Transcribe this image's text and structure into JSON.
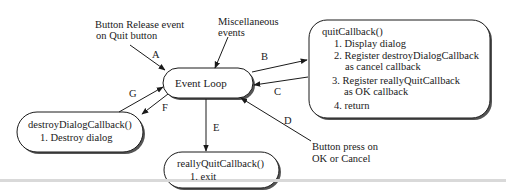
{
  "nodes": {
    "event_loop": {
      "label": "Event Loop"
    },
    "quit_callback": {
      "title": "quitCallback()",
      "steps": [
        "1. Display dialog",
        "2. Register destroyDialogCallback",
        "as cancel callback",
        "3. Register reallyQuitCallback",
        "as OK callback",
        "4. return"
      ]
    },
    "destroy_dialog_callback": {
      "title": "destroyDialogCallback()",
      "steps": [
        "1. Destroy dialog"
      ]
    },
    "really_quit_callback": {
      "title": "reallyQuitCallback()",
      "steps": [
        "1. exit"
      ]
    }
  },
  "external_events": {
    "button_release": {
      "line1": "Button Release event",
      "line2": "on Quit button"
    },
    "misc": {
      "line1": "Miscellaneous",
      "line2": "events"
    },
    "button_press": {
      "line1": "Button press on",
      "line2": "OK or Cancel"
    }
  },
  "edges": [
    {
      "id": "A",
      "from": "button_release",
      "to": "event_loop"
    },
    {
      "id": "B",
      "from": "event_loop",
      "to": "quit_callback"
    },
    {
      "id": "C",
      "from": "quit_callback",
      "to": "event_loop"
    },
    {
      "id": "D",
      "from": "button_press",
      "to": "event_loop"
    },
    {
      "id": "E",
      "from": "event_loop",
      "to": "really_quit_callback"
    },
    {
      "id": "F",
      "from": "event_loop",
      "to": "destroy_dialog_callback"
    },
    {
      "id": "G",
      "from": "destroy_dialog_callback",
      "to": "event_loop"
    }
  ],
  "colors": {
    "stroke": "#1a1a1a",
    "shadow": "#555555",
    "rule": "#d9d9d9"
  }
}
